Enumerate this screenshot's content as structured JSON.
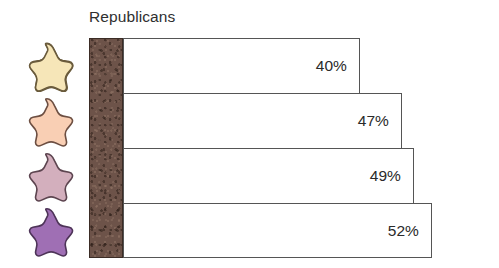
{
  "chart_data": {
    "type": "bar",
    "orientation": "horizontal",
    "title": "Republicans",
    "xlabel": "",
    "ylabel": "",
    "grid": false,
    "legend_position": "left",
    "categories": [
      "star-1",
      "star-2",
      "star-3",
      "star-4"
    ],
    "values": [
      40,
      47,
      49,
      52
    ],
    "value_labels": [
      "40%",
      "47%",
      "49%",
      "52%"
    ],
    "xlim": [
      0,
      60
    ],
    "bars": [
      {
        "label": "40%",
        "value": 40,
        "marker_color": "#f6e6b8"
      },
      {
        "label": "47%",
        "value": 47,
        "marker_color": "#f9cfb4"
      },
      {
        "label": "49%",
        "value": 49,
        "marker_color": "#d3afbd"
      },
      {
        "label": "52%",
        "value": 52,
        "marker_color": "#9f6fb4"
      }
    ]
  },
  "chart": {
    "title": "Republicans",
    "bar_fill": "#ffffff",
    "bar_stroke": "#555555",
    "axis_block_color": "#6d5349",
    "axis_block_stroke": "#3b2c25",
    "value_text_color": "#2a2a2a"
  },
  "legend": {
    "icon_name": "star-icon",
    "items": [
      {
        "name": "star-marker-1",
        "fill": "#f6e6b8",
        "stroke": "#6a5b3c"
      },
      {
        "name": "star-marker-2",
        "fill": "#f9cfb4",
        "stroke": "#6d4f42"
      },
      {
        "name": "star-marker-3",
        "fill": "#d3afbd",
        "stroke": "#5d4550"
      },
      {
        "name": "star-marker-4",
        "fill": "#9f6fb4",
        "stroke": "#4e3458"
      }
    ]
  }
}
